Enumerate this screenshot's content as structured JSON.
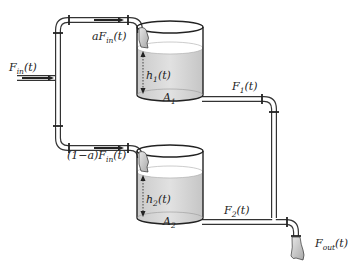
{
  "diagram": {
    "inflow_label": {
      "main": "F",
      "sub": "in",
      "arg": "(t)"
    },
    "upper_branch_label": {
      "prefix": "a",
      "main": "F",
      "sub": "in",
      "arg": "(t)"
    },
    "lower_branch_label": {
      "prefix": "(1−a)",
      "main": "F",
      "sub": "in",
      "arg": "(t)"
    },
    "tank1": {
      "level_label": {
        "main": "h",
        "sub": "1",
        "arg": "(t)"
      },
      "area_label": {
        "main": "A",
        "sub": "1"
      },
      "outflow_label": {
        "main": "F",
        "sub": "1",
        "arg": "(t)"
      }
    },
    "tank2": {
      "level_label": {
        "main": "h",
        "sub": "2",
        "arg": "(t)"
      },
      "area_label": {
        "main": "A",
        "sub": "2"
      },
      "outflow_label": {
        "main": "F",
        "sub": "2",
        "arg": "(t)"
      }
    },
    "outflow_label": {
      "main": "F",
      "sub": "out",
      "arg": "(t)"
    },
    "colors": {
      "liquid": "#cfcfcf",
      "liquid_top": "#bdbdbd",
      "line": "#222222",
      "background": "#ffffff"
    }
  }
}
